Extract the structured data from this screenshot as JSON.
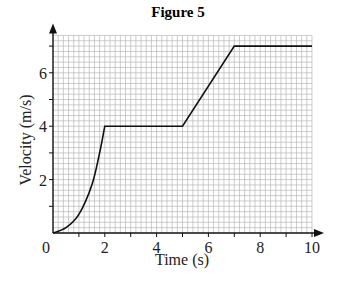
{
  "chart_data": {
    "type": "line",
    "title": "Figure 5",
    "xlabel": "Time (s)",
    "ylabel": "Velocity (m/s)",
    "xlim": [
      0,
      10
    ],
    "ylim": [
      0,
      7.4
    ],
    "x_ticks": [
      0,
      2,
      4,
      6,
      8,
      10
    ],
    "y_ticks": [
      2,
      4,
      6
    ],
    "grid": {
      "on": true,
      "minor_step": 0.2,
      "major_step": 1
    },
    "series": [
      {
        "name": "velocity",
        "segments": [
          {
            "kind": "curve",
            "points": [
              [
                0,
                0
              ],
              [
                0.5,
                0.2
              ],
              [
                1,
                0.7
              ],
              [
                1.5,
                1.8
              ],
              [
                1.8,
                3.0
              ],
              [
                2,
                4
              ]
            ]
          },
          {
            "kind": "line",
            "points": [
              [
                2,
                4
              ],
              [
                5,
                4
              ]
            ]
          },
          {
            "kind": "line",
            "points": [
              [
                5,
                4
              ],
              [
                7,
                7
              ]
            ]
          },
          {
            "kind": "line",
            "points": [
              [
                7,
                7
              ],
              [
                10,
                7
              ]
            ]
          }
        ],
        "x": [
          0,
          0.5,
          1,
          1.5,
          1.8,
          2,
          5,
          7,
          10
        ],
        "values": [
          0,
          0.2,
          0.7,
          1.8,
          3.0,
          4,
          4,
          7,
          7
        ]
      }
    ]
  },
  "colors": {
    "grid": "#b8b8b8",
    "axis": "#111111",
    "line": "#111111"
  }
}
